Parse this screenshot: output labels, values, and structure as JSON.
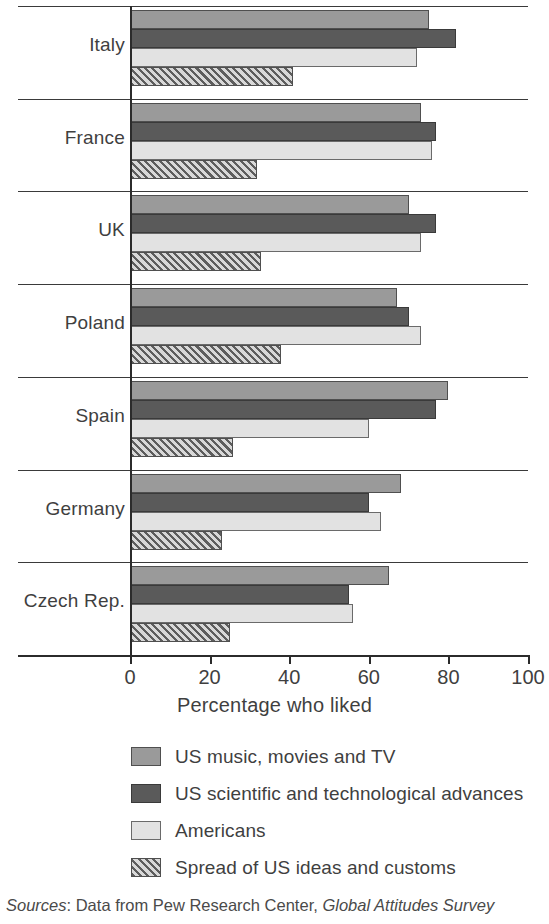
{
  "chart_data": {
    "type": "bar",
    "orientation": "horizontal",
    "title": "",
    "xlabel": "Percentage who liked",
    "ylabel": "",
    "xlim": [
      0,
      100
    ],
    "xticks": [
      0,
      20,
      40,
      60,
      80,
      100
    ],
    "xtick_labels": [
      "0",
      "20",
      "40",
      "60",
      "80",
      "100"
    ],
    "grid": true,
    "legend_position": "below",
    "categories": [
      "Italy",
      "France",
      "UK",
      "Poland",
      "Spain",
      "Germany",
      "Czech Rep."
    ],
    "series": [
      {
        "name": "US music, movies and TV",
        "color": "#9a9a9a",
        "values": [
          75,
          73,
          70,
          67,
          80,
          68,
          65
        ]
      },
      {
        "name": "US scientific and technological advances",
        "color": "#5a5a5a",
        "values": [
          82,
          77,
          77,
          70,
          77,
          60,
          55
        ]
      },
      {
        "name": "Americans",
        "color": "#e2e2e2",
        "values": [
          72,
          76,
          73,
          73,
          60,
          63,
          56
        ]
      },
      {
        "name": "Spread of US ideas and customs",
        "color": "#c9c9c9",
        "pattern": "diagonal-hatch",
        "values": [
          41,
          32,
          33,
          38,
          26,
          23,
          25
        ]
      }
    ]
  },
  "legend": {
    "items": [
      {
        "label": "US music, movies and TV"
      },
      {
        "label": "US scientific and technological advances"
      },
      {
        "label": "Americans"
      },
      {
        "label": "Spread of US ideas and customs"
      }
    ]
  },
  "source_note": {
    "label": "Sources",
    "middle": ": Data from Pew Research Center, ",
    "publication": "Global Attitudes Survey"
  }
}
